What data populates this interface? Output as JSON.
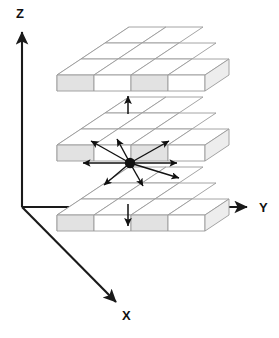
{
  "figure": {
    "background_color": "#ffffff",
    "width": 279,
    "height": 338
  },
  "axes": {
    "color": "#1a1a1a",
    "items": [
      {
        "id": "z",
        "label": "Z",
        "direction": "up",
        "label_x": 16,
        "label_y": 18
      },
      {
        "id": "y",
        "label": "Y",
        "direction": "right",
        "label_x": 259,
        "label_y": 212
      },
      {
        "id": "x",
        "label": "X",
        "direction": "down-forward",
        "label_x": 122,
        "label_y": 320
      }
    ],
    "origin": {
      "x": 22,
      "y": 207
    }
  },
  "grid": {
    "slabs": [
      {
        "id": "top-slab",
        "label": "z + 1",
        "rows": 3,
        "cols": 3,
        "origin_x": 57,
        "origin_y": 75
      },
      {
        "id": "middle-slab",
        "label": "z",
        "rows": 3,
        "cols": 3,
        "origin_x": 57,
        "origin_y": 145
      },
      {
        "id": "bottom-slab",
        "label": "z - 1",
        "rows": 3,
        "cols": 3,
        "origin_x": 57,
        "origin_y": 215
      }
    ],
    "cell_width": 37,
    "cell_depth": 24,
    "cell_height": 16,
    "face_colors": {
      "top": "#ffffff",
      "front_light": "#ffffff",
      "front_shaded": "#e2e2e2",
      "side": "#ededed",
      "edge": "#9a9a9a"
    }
  },
  "center_voxel": {
    "name": "center-voxel-marker",
    "x": 130,
    "y": 163,
    "radius": 5.2,
    "color": "#111111"
  },
  "neighbour_arrows": {
    "color": "#111111",
    "in_plane_count": 8,
    "vertical_count": 2,
    "total": 10,
    "in_plane": [
      {
        "id": "arrow-w",
        "dir": "west",
        "dx": -49,
        "dy": 0
      },
      {
        "id": "arrow-e",
        "dir": "east",
        "dx": 49,
        "dy": 0
      },
      {
        "id": "arrow-nw",
        "dir": "north-west",
        "dx": -41,
        "dy": -23
      },
      {
        "id": "arrow-ne",
        "dir": "north-east",
        "dx": 41,
        "dy": -23
      },
      {
        "id": "arrow-sw",
        "dir": "south-west",
        "dx": -28,
        "dy": 23
      },
      {
        "id": "arrow-se",
        "dir": "south-east",
        "dx": 28,
        "dy": 23
      },
      {
        "id": "arrow-n",
        "dir": "north",
        "dx": -9,
        "dy": -28
      },
      {
        "id": "arrow-s",
        "dir": "south",
        "dx": 9,
        "dy": 26
      }
    ],
    "vertical": [
      {
        "id": "arrow-up",
        "dir": "up",
        "x": 128,
        "y1": 114,
        "y2": 95
      },
      {
        "id": "arrow-down",
        "dir": "down",
        "x": 128,
        "y1": 204,
        "y2": 228
      }
    ]
  }
}
